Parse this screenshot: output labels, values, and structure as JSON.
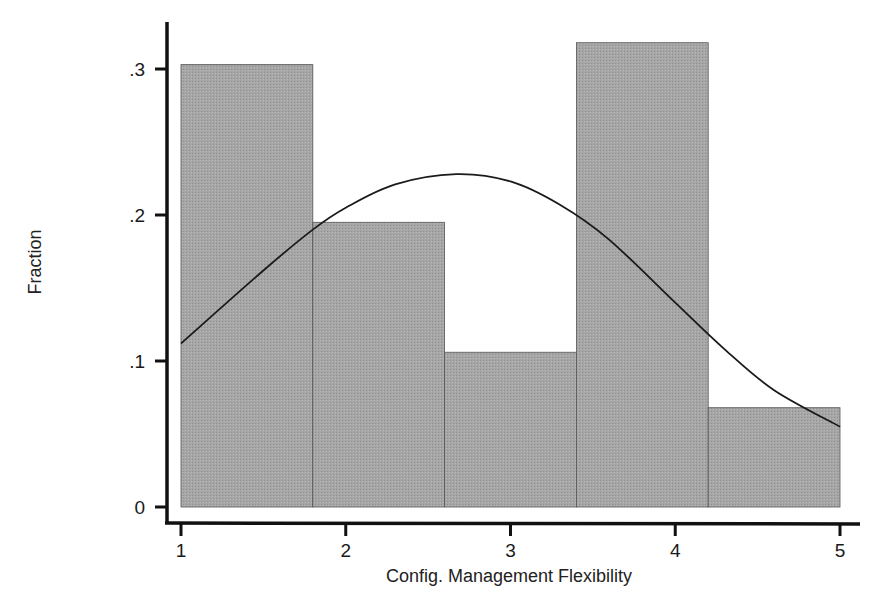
{
  "chart_data": {
    "type": "bar",
    "subtype": "histogram_with_normal_curve",
    "title": "",
    "xlabel": "Config. Management Flexibility",
    "ylabel": "Fraction",
    "xlim": [
      1,
      5
    ],
    "ylim": [
      0,
      0.33
    ],
    "x_ticks": [
      1,
      2,
      3,
      4,
      5
    ],
    "x_tick_labels": [
      "1",
      "2",
      "3",
      "4",
      "5"
    ],
    "y_ticks": [
      0,
      0.1,
      0.2,
      0.3
    ],
    "y_tick_labels": [
      "0",
      ".1",
      ".2",
      ".3"
    ],
    "grid": false,
    "legend": null,
    "bins": [
      {
        "start": 1.0,
        "end": 1.8,
        "value": 0.303
      },
      {
        "start": 1.8,
        "end": 2.6,
        "value": 0.195
      },
      {
        "start": 2.6,
        "end": 3.4,
        "value": 0.106
      },
      {
        "start": 3.4,
        "end": 4.2,
        "value": 0.318
      },
      {
        "start": 4.2,
        "end": 5.0,
        "value": 0.068
      }
    ],
    "categories": [
      "1.0-1.8",
      "1.8-2.6",
      "2.6-3.4",
      "3.4-4.2",
      "4.2-5.0"
    ],
    "values": [
      0.303,
      0.195,
      0.106,
      0.318,
      0.068
    ],
    "normal_curve": {
      "mean": 2.67,
      "peak": 0.228,
      "points": [
        {
          "x": 1.0,
          "y": 0.112
        },
        {
          "x": 1.5,
          "y": 0.162
        },
        {
          "x": 1.8,
          "y": 0.19
        },
        {
          "x": 2.0,
          "y": 0.205
        },
        {
          "x": 2.3,
          "y": 0.221
        },
        {
          "x": 2.67,
          "y": 0.228
        },
        {
          "x": 3.0,
          "y": 0.223
        },
        {
          "x": 3.3,
          "y": 0.207
        },
        {
          "x": 3.6,
          "y": 0.183
        },
        {
          "x": 4.0,
          "y": 0.14
        },
        {
          "x": 4.3,
          "y": 0.108
        },
        {
          "x": 4.6,
          "y": 0.08
        },
        {
          "x": 5.0,
          "y": 0.055
        }
      ]
    },
    "colors": {
      "bar_fill": "#a6a6a6",
      "bar_edge": "#555555",
      "curve": "#1a1a1a",
      "axis": "#111111"
    }
  }
}
